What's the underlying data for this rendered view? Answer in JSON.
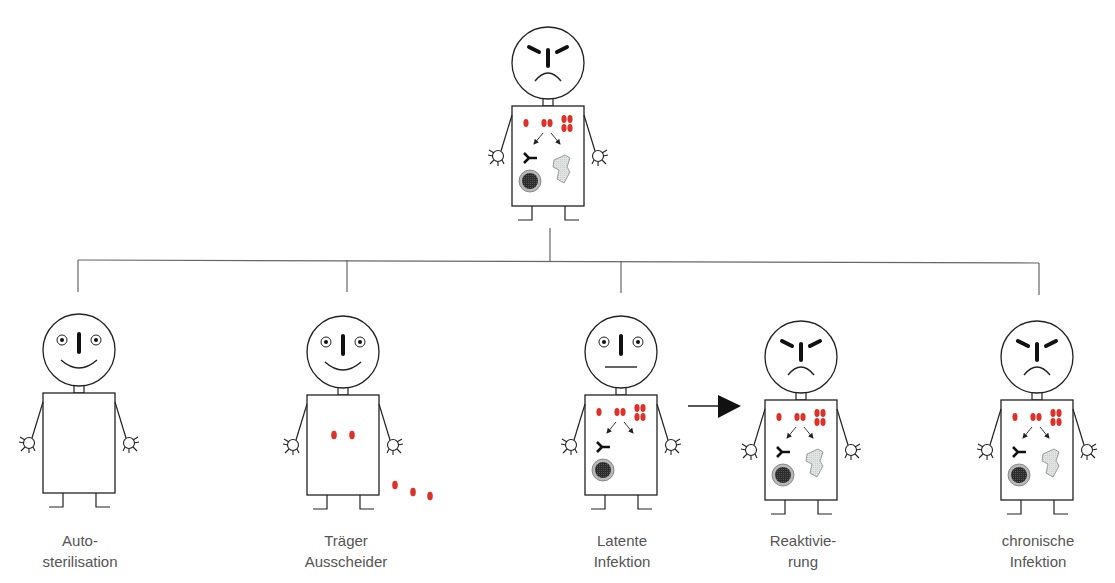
{
  "diagram": {
    "root": {
      "state": "akute Infektion",
      "mood": "angry",
      "contents": [
        "pathogen-replication",
        "arrows",
        "antibody",
        "infected-cell",
        "tissue-damage"
      ]
    },
    "outcomes": [
      {
        "label_line1": "Auto-",
        "label_line2": "sterilisation",
        "mood": "happy",
        "contents": []
      },
      {
        "label_line1": "Träger",
        "label_line2": "Ausscheider",
        "mood": "happy",
        "contents": [
          "pathogens",
          "shed-pathogens"
        ]
      },
      {
        "label_line1": "Latente",
        "label_line2": "Infektion",
        "mood": "neutral",
        "contents": [
          "pathogen-replication",
          "arrows",
          "antibody",
          "infected-cell"
        ]
      },
      {
        "label_line1": "Reaktivie-",
        "label_line2": "rung",
        "mood": "angry",
        "contents": [
          "pathogen-replication",
          "arrows",
          "antibody",
          "infected-cell",
          "tissue-damage"
        ]
      },
      {
        "label_line1": "chronische",
        "label_line2": "Infektion",
        "mood": "angry",
        "contents": [
          "pathogen-replication",
          "arrows",
          "antibody",
          "infected-cell",
          "tissue-damage"
        ]
      }
    ],
    "transition_arrow": {
      "from": "Latente Infektion",
      "to": "Reaktivierung"
    },
    "colors": {
      "pathogen": "#e0302a",
      "line": "#222222",
      "tree_line": "#666666",
      "cell_outer": "#b8b8b8",
      "cell_inner": "#333333",
      "tissue": "#e4e6e6",
      "label": "#555555"
    }
  }
}
